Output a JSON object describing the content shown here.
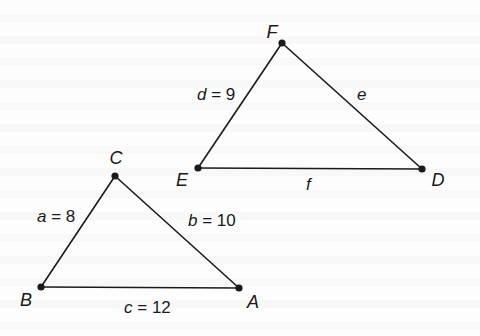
{
  "diagram": {
    "type": "similar-triangles",
    "colors": {
      "background": "#fdfdfd",
      "stroke": "#1a1a1a"
    },
    "triangle_abc": {
      "vertices": {
        "A": {
          "label": "A",
          "x": 239,
          "y": 288,
          "lx": 253,
          "ly": 303
        },
        "B": {
          "label": "B",
          "x": 41,
          "y": 287,
          "lx": 26,
          "ly": 303
        },
        "C": {
          "label": "C",
          "x": 115,
          "y": 176,
          "lx": 115,
          "ly": 163
        }
      },
      "sides": {
        "a": {
          "var": "a",
          "eq": " = ",
          "value": "8",
          "text": "a = 8"
        },
        "b": {
          "var": "b",
          "eq": " = ",
          "value": "10",
          "text": "b = 10"
        },
        "c": {
          "var": "c",
          "eq": " = ",
          "value": "12",
          "text": "c = 12"
        }
      }
    },
    "triangle_def": {
      "vertices": {
        "D": {
          "label": "D",
          "x": 422,
          "y": 169,
          "lx": 437,
          "ly": 185
        },
        "E": {
          "label": "E",
          "x": 198,
          "y": 168,
          "lx": 181,
          "ly": 185
        },
        "F": {
          "label": "F",
          "x": 282,
          "y": 43,
          "lx": 271,
          "ly": 37
        }
      },
      "sides": {
        "d": {
          "var": "d",
          "eq": " = ",
          "value": "9",
          "text": "d = 9"
        },
        "e": {
          "var": "e",
          "text": "e"
        },
        "f": {
          "var": "f",
          "text": "f"
        }
      }
    }
  }
}
